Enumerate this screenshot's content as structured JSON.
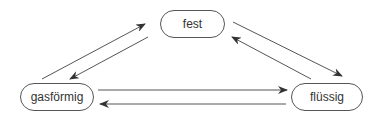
{
  "diagram": {
    "nodes": [
      {
        "id": "fest",
        "label": "fest"
      },
      {
        "id": "gasfoermig",
        "label": "gasförmig"
      },
      {
        "id": "fluessig",
        "label": "flüssig"
      }
    ],
    "edges": [
      {
        "from": "gasfoermig",
        "to": "fest"
      },
      {
        "from": "fest",
        "to": "gasfoermig"
      },
      {
        "from": "fest",
        "to": "fluessig"
      },
      {
        "from": "fluessig",
        "to": "fest"
      },
      {
        "from": "gasfoermig",
        "to": "fluessig"
      },
      {
        "from": "fluessig",
        "to": "gasfoermig"
      }
    ],
    "colors": {
      "line": "#555555",
      "text": "#333333"
    }
  }
}
